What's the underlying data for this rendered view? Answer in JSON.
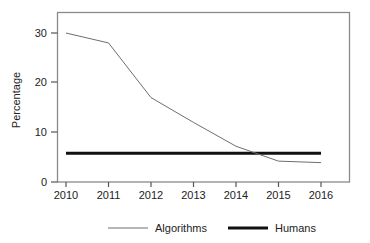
{
  "chart_data": {
    "type": "line",
    "title": "",
    "xlabel": "",
    "ylabel": "Percentage",
    "x": [
      2010,
      2011,
      2012,
      2013,
      2014,
      2015,
      2016
    ],
    "categories": [
      "2010",
      "2011",
      "2012",
      "2013",
      "2014",
      "2015",
      "2016"
    ],
    "xlim": [
      2010,
      2016
    ],
    "ylim": [
      0,
      34
    ],
    "yticks": [
      0,
      10,
      20,
      30
    ],
    "ytick_labels": [
      "0",
      "10",
      "20",
      "30"
    ],
    "xticks": [
      2010,
      2011,
      2012,
      2013,
      2014,
      2015,
      2016
    ],
    "xtick_labels": [
      "2010",
      "2011",
      "2012",
      "2013",
      "2014",
      "2015",
      "2016"
    ],
    "grid": false,
    "legend_position": "bottom",
    "series": [
      {
        "name": "Algorithms",
        "color": "#6e6e6e",
        "line_width": 1,
        "values": [
          30.0,
          28.0,
          17.0,
          12.0,
          7.2,
          4.2,
          3.9
        ]
      },
      {
        "name": "Humans",
        "color": "#111111",
        "line_width": 3,
        "values": [
          5.8,
          5.8,
          5.8,
          5.8,
          5.8,
          5.8,
          5.8
        ]
      }
    ]
  },
  "legend": {
    "entries": [
      {
        "label": "Algorithms",
        "color": "#6e6e6e",
        "width": 1
      },
      {
        "label": "Humans",
        "color": "#111111",
        "width": 3
      }
    ]
  },
  "axes": {
    "y_title": "Percentage"
  },
  "colors": {
    "frame": "#8a8a8a",
    "algorithms": "#6e6e6e",
    "humans": "#111111",
    "text": "#222222",
    "background": "#ffffff"
  }
}
